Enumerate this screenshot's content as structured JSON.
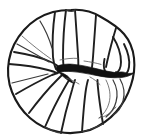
{
  "figure": {
    "title": "Line drawing of a discoidal multi-chambered microfossil specimen",
    "subject_name": "planispiral foraminiferal test, umbilical view",
    "medium": "ink line drawing",
    "background_color": "#ffffff",
    "line_color": "#1a1a1a",
    "aperture_color": "#111111",
    "canvas": {
      "width_px": 142,
      "height_px": 140
    },
    "specimen": {
      "outline_shape": "rounded lobate disc",
      "center_x": 71,
      "center_y": 72,
      "radius_x": 63,
      "radius_y": 62,
      "chamber_count": 14,
      "has_central_aperture_slit": true,
      "aperture_orientation": "horizontal, left of centre extending to right margin",
      "aperture_span_px": 72
    },
    "parts": [
      {
        "id": "outline",
        "label": "specimen-outline",
        "description": "lobate peripheral margin of the test"
      },
      {
        "id": "chambers",
        "label": "chamber-septa",
        "description": "radiating septal walls dividing the chambers"
      },
      {
        "id": "aperture",
        "label": "aperture-slit",
        "description": "dark wedge-shaped central aperture"
      },
      {
        "id": "umbilicus",
        "label": "umbilical-region",
        "description": "depressed central area where septa converge"
      },
      {
        "id": "final-chamber",
        "label": "final-chamber",
        "description": "inflated last-formed chamber on the right margin"
      }
    ],
    "annotations": {
      "scale_bar": "",
      "caption": "",
      "figure_number": ""
    }
  }
}
